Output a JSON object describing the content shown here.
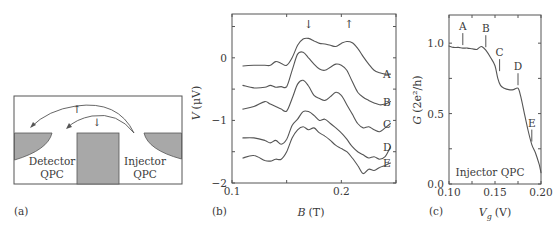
{
  "figure": {
    "panels": [
      {
        "id": "a",
        "label": "(a)"
      },
      {
        "id": "b",
        "label": "(b)"
      },
      {
        "id": "c",
        "label": "(c)"
      }
    ]
  },
  "diagram": {
    "detector_label_line1": "Detector",
    "detector_label_line2": "QPC",
    "injector_label_line1": "Injector",
    "injector_label_line2": "QPC",
    "spin_up_arrow": "↑",
    "spin_down_arrow": "↓",
    "fill_color": "#a8a8a8"
  },
  "chart_data": [
    {
      "panel": "b",
      "type": "line",
      "title": "",
      "xlabel": "B (T)",
      "xlabel_var": "B",
      "xlabel_unit": "(T)",
      "ylabel": "V (μV)",
      "ylabel_var": "V",
      "ylabel_unit": "(μV)",
      "xlim": [
        0.1,
        0.25
      ],
      "ylim": [
        -2,
        0.7
      ],
      "xticks": [
        0.1,
        0.15,
        0.2,
        0.25
      ],
      "xticklabels": [
        "0.1",
        "",
        "0.2",
        ""
      ],
      "yticks": [
        -2,
        -1.5,
        -1,
        -0.5,
        0,
        0.5
      ],
      "yticklabels": [
        "−2",
        "",
        "−1",
        "",
        "0",
        ""
      ],
      "grid": false,
      "annotations": [
        {
          "text": "↓",
          "x": 0.17,
          "note": "spin-down peak marker"
        },
        {
          "text": "↑",
          "x": 0.207,
          "note": "spin-up peak marker"
        }
      ],
      "x": [
        0.11,
        0.12,
        0.13,
        0.135,
        0.14,
        0.145,
        0.15,
        0.155,
        0.16,
        0.165,
        0.17,
        0.175,
        0.18,
        0.185,
        0.19,
        0.195,
        0.2,
        0.205,
        0.21,
        0.215,
        0.22,
        0.225,
        0.23,
        0.235,
        0.24,
        0.245
      ],
      "series": [
        {
          "name": "A",
          "values": [
            -0.13,
            -0.12,
            -0.12,
            -0.12,
            -0.06,
            -0.09,
            -0.12,
            0.0,
            0.2,
            0.3,
            0.31,
            0.27,
            0.23,
            0.22,
            0.2,
            0.18,
            0.23,
            0.26,
            0.24,
            0.15,
            0.02,
            -0.1,
            -0.2,
            -0.24,
            -0.26,
            -0.26
          ]
        },
        {
          "name": "B",
          "values": [
            -0.44,
            -0.48,
            -0.47,
            -0.44,
            -0.47,
            -0.46,
            -0.46,
            -0.2,
            0.06,
            0.09,
            0.0,
            -0.1,
            -0.18,
            -0.2,
            -0.15,
            -0.1,
            -0.12,
            -0.2,
            -0.38,
            -0.55,
            -0.63,
            -0.68,
            -0.72,
            -0.75,
            -0.74,
            -0.7
          ]
        },
        {
          "name": "C",
          "values": [
            -0.82,
            -0.78,
            -0.7,
            -0.74,
            -0.78,
            -0.82,
            -0.85,
            -0.65,
            -0.42,
            -0.36,
            -0.45,
            -0.6,
            -0.65,
            -0.68,
            -0.62,
            -0.55,
            -0.6,
            -0.75,
            -0.9,
            -1.05,
            -1.12,
            -1.1,
            -1.15,
            -1.18,
            -1.12,
            -1.05
          ]
        },
        {
          "name": "D",
          "values": [
            -1.28,
            -1.28,
            -1.32,
            -1.36,
            -1.32,
            -1.38,
            -1.3,
            -1.08,
            -0.98,
            -0.86,
            -0.86,
            -0.92,
            -1.0,
            -0.98,
            -1.05,
            -1.12,
            -1.2,
            -1.3,
            -1.42,
            -1.5,
            -1.55,
            -1.6,
            -1.58,
            -1.62,
            -1.58,
            -1.42
          ]
        },
        {
          "name": "E",
          "values": [
            -1.6,
            -1.56,
            -1.64,
            -1.65,
            -1.62,
            -1.62,
            -1.5,
            -1.28,
            -1.15,
            -1.1,
            -1.15,
            -1.12,
            -1.2,
            -1.25,
            -1.32,
            -1.4,
            -1.45,
            -1.5,
            -1.6,
            -1.72,
            -1.85,
            -1.78,
            -1.8,
            -1.75,
            -1.72,
            -1.68
          ]
        }
      ],
      "series_labels": [
        "A",
        "B",
        "C",
        "D",
        "E"
      ]
    },
    {
      "panel": "c",
      "type": "line",
      "title": "",
      "xlabel": "Vg (V)",
      "xlabel_var": "V",
      "xlabel_sub": "g",
      "xlabel_unit": "(V)",
      "ylabel": "G (2e²/h)",
      "ylabel_var": "G",
      "ylabel_unit": "(2e²/h)",
      "xlim": [
        0.1,
        0.2
      ],
      "ylim": [
        0.0,
        1.2
      ],
      "xticks": [
        0.1,
        0.125,
        0.15,
        0.175,
        0.2
      ],
      "xticklabels": [
        "0.10",
        "",
        "0.15",
        "",
        "0.20"
      ],
      "yticks": [
        0.0,
        0.25,
        0.5,
        0.75,
        1.0
      ],
      "yticklabels": [
        "0.0",
        "",
        "0.5",
        "",
        "1.0"
      ],
      "grid": false,
      "inset_text": "Injector QPC",
      "x": [
        0.1,
        0.105,
        0.11,
        0.115,
        0.12,
        0.125,
        0.13,
        0.133,
        0.136,
        0.14,
        0.145,
        0.15,
        0.153,
        0.156,
        0.16,
        0.165,
        0.17,
        0.175,
        0.178,
        0.182,
        0.186,
        0.19,
        0.194,
        0.198,
        0.2
      ],
      "series": [
        {
          "name": "Injector QPC",
          "values": [
            0.98,
            0.97,
            0.97,
            0.965,
            0.965,
            0.96,
            0.955,
            0.97,
            0.975,
            0.95,
            0.9,
            0.84,
            0.75,
            0.7,
            0.68,
            0.67,
            0.67,
            0.68,
            0.62,
            0.5,
            0.38,
            0.28,
            0.22,
            0.14,
            0.08
          ]
        }
      ],
      "markers": [
        {
          "label": "A",
          "x": 0.115,
          "y": 0.965
        },
        {
          "label": "B",
          "x": 0.14,
          "y": 0.95
        },
        {
          "label": "C",
          "x": 0.155,
          "y": 0.78
        },
        {
          "label": "D",
          "x": 0.175,
          "y": 0.68
        },
        {
          "label": "E",
          "x": 0.19,
          "y": 0.28
        }
      ]
    }
  ]
}
